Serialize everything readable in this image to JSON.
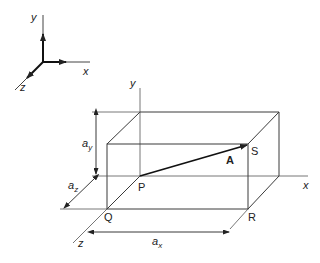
{
  "figure": {
    "type": "3D vector component diagram",
    "colors": {
      "line": "#3a3a3a",
      "light_line": "#7a7a7a",
      "text": "#222222"
    }
  },
  "axes_inset": {
    "x_axis_label": "x",
    "y_axis_label": "y",
    "z_axis_label": "z",
    "unit_vector_x": "i",
    "unit_vector_y": "j",
    "unit_vector_z": "k"
  },
  "main": {
    "y_axis_label": "y",
    "x_axis_label": "x",
    "z_axis_label": "z",
    "points": {
      "P": "P",
      "Q": "Q",
      "R": "R",
      "S": "S"
    },
    "vector_label": "A",
    "dimensions": {
      "ax": {
        "base": "a",
        "sub": "x"
      },
      "ay": {
        "base": "a",
        "sub": "y"
      },
      "az": {
        "base": "a",
        "sub": "z"
      }
    }
  }
}
